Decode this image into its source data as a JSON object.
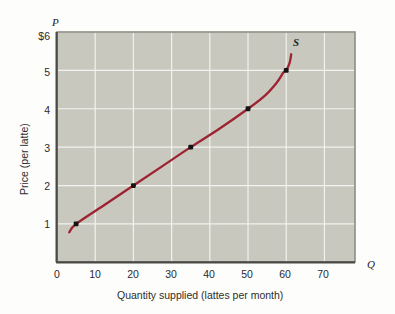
{
  "chart_data": {
    "type": "line",
    "title": "",
    "subtitle": "",
    "xlabel": "Quantity supplied (lattes per month)",
    "ylabel": "Price (per latte)",
    "x_axis_letter": "Q",
    "y_axis_letter": "P",
    "xlim": [
      0,
      78
    ],
    "ylim": [
      0,
      6
    ],
    "xticks": [
      "0",
      "10",
      "20",
      "30",
      "40",
      "50",
      "60",
      "70"
    ],
    "xtick_values": [
      0,
      10,
      20,
      30,
      40,
      50,
      60,
      70
    ],
    "yticks": [
      "$6",
      "5",
      "4",
      "3",
      "2",
      "1"
    ],
    "ytick_values": [
      6,
      5,
      4,
      3,
      2,
      1
    ],
    "grid": true,
    "grid_color": "#f2f2ee",
    "plot_bgcolor": "#c8c8bf",
    "legend_position": "none",
    "series": [
      {
        "name": "S",
        "label": "S",
        "label_x": 61,
        "label_y": 5.65,
        "color": "#9e2230",
        "marker_color": "#141414",
        "x": [
          5,
          20,
          35,
          50,
          60
        ],
        "y": [
          1,
          2,
          3,
          4,
          5
        ],
        "curve_points": [
          [
            3.2,
            0.78
          ],
          [
            5,
            1.0
          ],
          [
            12.5,
            1.5
          ],
          [
            20,
            2.0
          ],
          [
            27.5,
            2.5
          ],
          [
            35,
            3.0
          ],
          [
            42.5,
            3.48
          ],
          [
            50,
            4.0
          ],
          [
            54.5,
            4.35
          ],
          [
            57.5,
            4.68
          ],
          [
            59.3,
            4.95
          ],
          [
            60,
            5.0
          ],
          [
            60.9,
            5.2
          ],
          [
            61.3,
            5.42
          ]
        ],
        "annotation": "Upward-sloping supply curve"
      }
    ]
  }
}
